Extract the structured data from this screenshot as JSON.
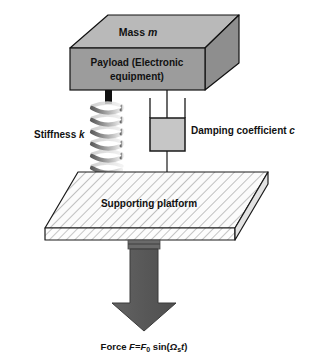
{
  "figure": {
    "background_color": "#ffffff"
  },
  "labels": {
    "mass": "Mass ",
    "mass_symbol": "m",
    "payload_line1": "Payload (Electronic",
    "payload_line2": "equipment)",
    "stiffness": "Stiffness ",
    "stiffness_symbol": "k",
    "damping": "Damping coefficient ",
    "damping_symbol": "c",
    "platform": "Supporting platform",
    "force_prefix": "Force ",
    "force_symbol_f": "F",
    "force_equals": "=",
    "force_f0": "F",
    "force_f0_sub": "0",
    "force_sin": " sin(",
    "force_omega": "Ω",
    "force_omega_sub": "s",
    "force_t": "t",
    "force_close": ")"
  },
  "colors": {
    "block_top_face": "#b9b9b9",
    "block_front_face": "#9c9c9c",
    "block_side_face": "#8e8e8e",
    "block_outline": "#111111",
    "damper_fill": "#c6c6c6",
    "damper_outline": "#111111",
    "platform_fill": "#fbfbfb",
    "platform_hatch": "#8a8a8a",
    "platform_outline": "#1a1a1a",
    "arrow_fill": "#5b5b5b",
    "arrow_outline": "#3a3a3a",
    "connector_black": "#111111",
    "spring_dark": "#6f6f6f",
    "spring_light": "#e8e8e8",
    "text_color": "#111111"
  },
  "components": {
    "mass_block": {
      "shape": "3d-box",
      "coils_label": "payload mass m"
    },
    "spring": {
      "shape": "helical-coil",
      "coil_count": 6
    },
    "damper": {
      "shape": "dashpot-cylinder"
    },
    "platform": {
      "shape": "hatched-parallelogram-slab"
    },
    "force_arrow": {
      "shape": "down-arrow",
      "direction": "down"
    }
  }
}
